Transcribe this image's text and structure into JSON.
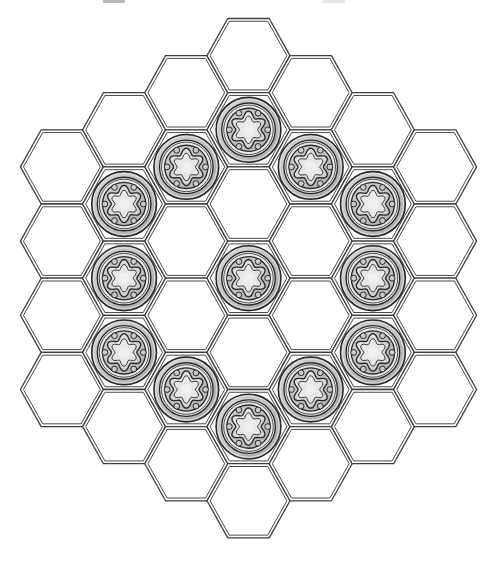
{
  "figure": {
    "background": "#ffffff",
    "board": {
      "center_x": 248.5,
      "center_y": 278.2,
      "hex_half_width": 41.5,
      "hex_height": 74.2,
      "col_spacing": 62.2,
      "col_heights": [
        4,
        5,
        6,
        7,
        6,
        5,
        4
      ],
      "cell_count": 37,
      "cell_fill": "#ffffff",
      "line_color": "#3f3f3f",
      "inner_line_color": "#4a4a4a",
      "outer_line_width": 1.3,
      "inner_line_width": 1.0,
      "inner_inset_scale": 0.925
    },
    "pieces": {
      "count": 13,
      "pattern": "center hex plus full ring at hex-distance 2",
      "positions": [
        {
          "col": -2,
          "row": 1
        },
        {
          "col": -2,
          "row": 2
        },
        {
          "col": -2,
          "row": 3
        },
        {
          "col": -1,
          "row": 1
        },
        {
          "col": -1,
          "row": 4
        },
        {
          "col": 0,
          "row": 1
        },
        {
          "col": 0,
          "row": 3
        },
        {
          "col": 0,
          "row": 5
        },
        {
          "col": 1,
          "row": 1
        },
        {
          "col": 1,
          "row": 4
        },
        {
          "col": 2,
          "row": 1
        },
        {
          "col": 2,
          "row": 2
        },
        {
          "col": 2,
          "row": 3
        }
      ],
      "style": {
        "outline": "#2a2a2a",
        "outer_radius": 32.4,
        "rim_fill_light": "#d8d8d8",
        "rim_fill_dark": "#a6a6a6",
        "rim_highlight_radius": 30.6,
        "rim_highlight_color": "#dcdcdc",
        "ring_radius": 26.8,
        "ring_fill": "#e8e8e8",
        "ring2_radius": 24.8,
        "field_radius": 21.6,
        "field_fill_light": "#d0d0d0",
        "field_fill_dark": "#b2b2b2",
        "bead_dist": 19.2,
        "bead_radius": 2.9,
        "bead_fill": "#c9c9c9",
        "flower_base": 15.7,
        "flower_amp": 3.0,
        "flower_fill_light": "#efefef",
        "flower_fill_dark": "#c6c6c6",
        "flower_inner_base": 11.4,
        "flower_inner_amp": 2.3,
        "flower_inner_fill": "#e7e7e7",
        "center_radius": 5.5,
        "center_fill": "#efefef"
      }
    },
    "artifacts": [
      {
        "x": 103,
        "y": 0,
        "width": 22,
        "height": 3,
        "color": "#aaaaaa"
      },
      {
        "x": 323,
        "y": 0,
        "width": 22,
        "height": 3,
        "color": "#dedede"
      }
    ]
  }
}
